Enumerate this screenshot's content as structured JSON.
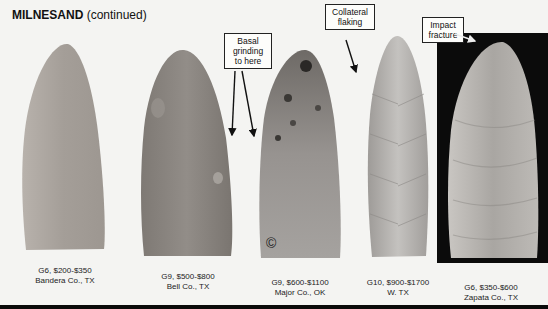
{
  "header": {
    "title_bold": "MILNESAND",
    "title_suffix": " (continued)"
  },
  "callouts": [
    {
      "id": "basal",
      "lines": [
        "Basal",
        "grinding",
        "to here"
      ]
    },
    {
      "id": "collateral",
      "lines": [
        "Collateral",
        "flaking"
      ]
    },
    {
      "id": "impact",
      "lines": [
        "Impact",
        "fracture"
      ]
    }
  ],
  "artifacts": [
    {
      "grade_price": "G6, $200-$350",
      "location": "Bandera Co., TX",
      "color": "#a9a39d"
    },
    {
      "grade_price": "G9, $500-$800",
      "location": "Bell Co., TX",
      "color": "#8a8580"
    },
    {
      "grade_price": "G9, $600-$1100",
      "location": "Major Co., OK",
      "color": "#8e8a86",
      "mark": "©"
    },
    {
      "grade_price": "G10, $900-$1700",
      "location": "W. TX",
      "color": "#b2b0ad"
    },
    {
      "grade_price": "G6, $350-$600",
      "location": "Zapata Co., TX",
      "color": "#b9b6b2"
    }
  ],
  "colors": {
    "background": "#f4f4f2",
    "panel": "#0b0b0b",
    "text": "#222222"
  }
}
